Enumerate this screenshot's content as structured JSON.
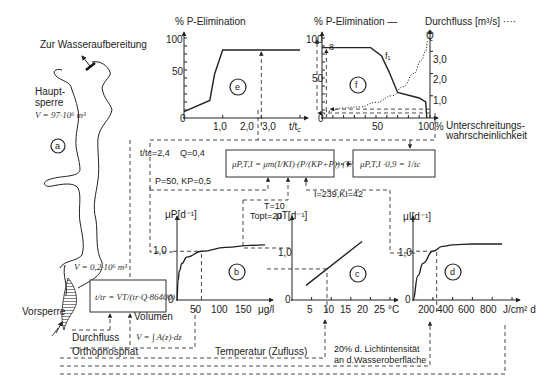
{
  "reservoir": {
    "outlet_label": "Zur Wasseraufbereitung",
    "main_dam_label_1": "Haupt-",
    "main_dam_label_2": "sperre",
    "main_volume": "V = 97·10⁶ m³",
    "pre_dam_label": "Vorsperre",
    "pre_volume": "V = 0,2·10⁶ m³",
    "marker": "a"
  },
  "chart_data": [
    {
      "id": "e",
      "type": "line",
      "title": "% P-Elimination",
      "xlabel": "t/t_c",
      "ylabel": "% P-Elimination",
      "x_ticks": [
        "1,0",
        "2,0",
        "3,0"
      ],
      "y_ticks": [
        "0",
        "50",
        "100"
      ],
      "xlim": [
        0,
        3.6
      ],
      "ylim": [
        0,
        100
      ],
      "series": [
        {
          "name": "P-Elimination",
          "x": [
            0,
            0.8,
            0.95,
            1.2,
            3.6
          ],
          "y": [
            8,
            22,
            55,
            85,
            85
          ]
        }
      ],
      "marker": "e",
      "annotation_x": 2.4
    },
    {
      "id": "f",
      "type": "line",
      "title": "% P-Elimination —",
      "title2": "Durchfluss [m³/s] ····",
      "xlabel": "Unterschreitungs-wahrscheinlichkeit",
      "x_ticks": [
        "50",
        "100%"
      ],
      "y_ticks": [
        "0",
        "50",
        "100"
      ],
      "y2_label": "Q",
      "y2_ticks": [
        "1,0",
        "2,0",
        "3,0"
      ],
      "xlim": [
        0,
        100
      ],
      "ylim": [
        0,
        100
      ],
      "y2lim": [
        0,
        3.6
      ],
      "series": [
        {
          "name": "P-Elimination (f1)",
          "x": [
            0,
            45,
            55,
            62,
            70,
            90,
            96,
            97
          ],
          "y": [
            88,
            88,
            78,
            58,
            32,
            25,
            20,
            0
          ]
        },
        {
          "name": "Durchfluss Q",
          "x": [
            0,
            5,
            20,
            35,
            50,
            65,
            75,
            85,
            92,
            96,
            98
          ],
          "y2": [
            0.1,
            0.3,
            0.45,
            0.5,
            0.7,
            1.0,
            1.4,
            2.0,
            2.6,
            3.0,
            3.5
          ]
        }
      ],
      "curve_label": "f₁",
      "annotation_label": "8",
      "marker": "f"
    },
    {
      "id": "b",
      "type": "line",
      "ylabel": "μP[d⁻¹]",
      "x_ticks": [
        "50",
        "100",
        "150",
        "μg/l"
      ],
      "y_ticks": [
        "0",
        "1,0"
      ],
      "xlim": [
        0,
        180
      ],
      "ylim": [
        0,
        1.6
      ],
      "series": [
        {
          "name": "μP",
          "x": [
            0,
            2,
            5,
            10,
            20,
            50,
            100,
            150,
            180
          ],
          "y": [
            0,
            0.4,
            0.6,
            0.75,
            0.88,
            1.0,
            1.08,
            1.12,
            1.13
          ]
        }
      ],
      "marker": "b"
    },
    {
      "id": "c",
      "type": "line",
      "ylabel": "μT[d⁻¹]",
      "x_ticks": [
        "5",
        "10",
        "15",
        "20",
        "25",
        "°C"
      ],
      "y_ticks": [
        "0",
        "1,0"
      ],
      "xlim": [
        0,
        28
      ],
      "ylim": [
        0,
        1.6
      ],
      "series": [
        {
          "name": "μT",
          "x": [
            4,
            20
          ],
          "y": [
            0.3,
            1.2
          ]
        }
      ],
      "marker": "c"
    },
    {
      "id": "d",
      "type": "line",
      "ylabel": "μI[d⁻¹]",
      "x_ticks": [
        "200",
        "400",
        "600",
        "800",
        "J/cm² d"
      ],
      "y_ticks": [
        "0",
        "1,0"
      ],
      "xlim": [
        0,
        1000
      ],
      "ylim": [
        0,
        1.6
      ],
      "series": [
        {
          "name": "μI",
          "x": [
            0,
            50,
            100,
            200,
            300,
            400,
            600,
            900
          ],
          "y": [
            0,
            0.5,
            0.75,
            1.0,
            1.1,
            1.13,
            1.15,
            1.15
          ]
        }
      ],
      "marker": "d"
    }
  ],
  "params": {
    "ttc": "t/tc=2,4",
    "q": "Q=0,4",
    "p": "P=50,  KP=0,5",
    "t": "T=10",
    "topt": "Topt=20",
    "i": "I=239,KI=42"
  },
  "formulas": {
    "growth": "μP,T,I = μm(I/KI)·(P/(KP+P))·(T/Topt)",
    "result": "μP,T,I ·0,9 = 1/tc",
    "residence": "t/tr = VT/(tr·Q·86400)",
    "volume": "V = ∫ A(z)·dz"
  },
  "inputs": {
    "volume": "Volumen",
    "flow": "Durchfluss",
    "orthophosphate": "Orthophosphat",
    "temperature": "Temperatur (Zufluss)",
    "light_1": "20% d. Lichtintensität",
    "light_2": "an d.Wasseroberfläche"
  }
}
